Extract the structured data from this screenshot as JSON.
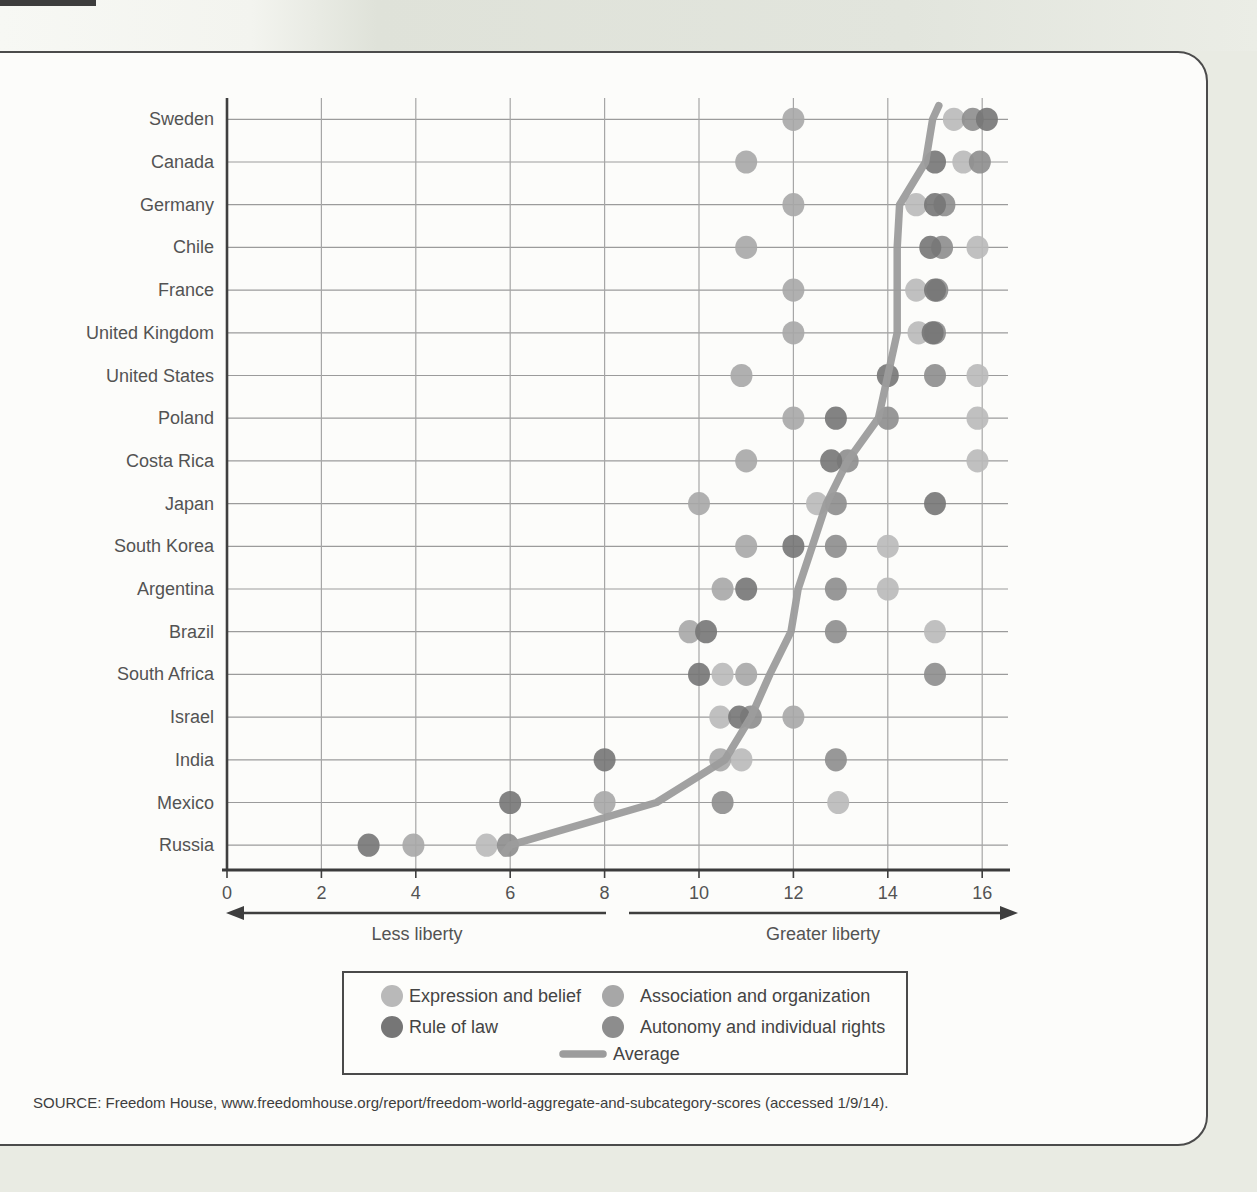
{
  "page": {
    "source_line": "SOURCE: Freedom House, www.freedomhouse.org/report/freedom-world-aggregate-and-subcategory-scores (accessed 1/9/14)."
  },
  "chart_data": {
    "type": "scatter",
    "title": "",
    "orientation": "horizontal-dot-plot",
    "grid": true,
    "x_axis": {
      "min": 0,
      "max": 16,
      "tick_step": 2,
      "ticks": [
        0,
        2,
        4,
        6,
        8,
        10,
        12,
        14,
        16
      ]
    },
    "axis_annotations": {
      "left": "Less liberty",
      "right": "Greater liberty"
    },
    "countries": [
      "Sweden",
      "Canada",
      "Germany",
      "Chile",
      "France",
      "United Kingdom",
      "United States",
      "Poland",
      "Costa Rica",
      "Japan",
      "South Korea",
      "Argentina",
      "Brazil",
      "South Africa",
      "Israel",
      "India",
      "Mexico",
      "Russia"
    ],
    "series": [
      {
        "key": "expression",
        "name": "Expression and belief",
        "kind": "dots",
        "color": "#b9b9b9",
        "values": [
          15.4,
          15.6,
          14.6,
          15.9,
          14.6,
          14.65,
          15.9,
          15.9,
          15.9,
          12.5,
          14.0,
          14.0,
          15.0,
          10.5,
          10.45,
          10.9,
          12.95,
          5.5
        ]
      },
      {
        "key": "association",
        "name": "Association and organization",
        "kind": "dots",
        "color": "#a7a7a7",
        "values": [
          12.0,
          11.0,
          12.0,
          11.0,
          12.0,
          12.0,
          10.9,
          12.0,
          11.0,
          10.0,
          11.0,
          10.5,
          9.8,
          11.0,
          12.0,
          10.45,
          8.0,
          3.95
        ]
      },
      {
        "key": "rule_of_law",
        "name": "Rule of law",
        "kind": "dots",
        "color": "#767676",
        "values": [
          16.1,
          15.0,
          15.0,
          14.9,
          15.0,
          14.95,
          14.0,
          12.9,
          12.8,
          15.0,
          12.0,
          11.0,
          10.15,
          10.0,
          10.85,
          8.0,
          6.0,
          3.0
        ]
      },
      {
        "key": "autonomy",
        "name": "Autonomy and individual rights",
        "kind": "dots",
        "color": "#8d8d8d",
        "values": [
          15.8,
          15.95,
          15.2,
          15.15,
          15.05,
          15.0,
          15.0,
          14.0,
          13.15,
          12.9,
          12.9,
          12.9,
          12.9,
          15.0,
          11.1,
          12.9,
          10.5,
          5.95
        ]
      },
      {
        "key": "average",
        "name": "Average",
        "kind": "line",
        "color": "#9c9c9c",
        "values": [
          14.95,
          14.8,
          14.25,
          14.2,
          14.2,
          14.2,
          14.0,
          13.8,
          13.15,
          12.7,
          12.4,
          12.1,
          11.95,
          11.5,
          11.1,
          10.55,
          9.1,
          6.0
        ]
      }
    ],
    "legend_position": "bottom-center-boxed"
  }
}
